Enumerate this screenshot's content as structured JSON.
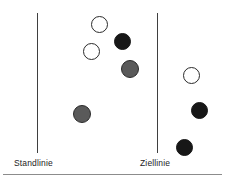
{
  "figure": {
    "width": 225,
    "height": 183,
    "background": "#ffffff"
  },
  "labels": {
    "start_line": "Standlinie",
    "target_line": "Ziellinie"
  },
  "colors": {
    "line": "#3f3f3f",
    "baseline": "#8c8c8c",
    "text": "#1c1c1c",
    "white_token_fill": "#ffffff",
    "white_token_stroke": "#2b2b2b",
    "black_token_fill": "#171717",
    "gray_token_fill": "#5a5a5a",
    "gray_token_stroke": "#2b2b2b"
  },
  "lines": [
    {
      "name": "standlinie-line",
      "x": 37,
      "y_top": 13,
      "y_bottom": 153
    },
    {
      "name": "ziellinie-line",
      "x": 157,
      "y_top": 13,
      "y_bottom": 153
    }
  ],
  "baseline": {
    "x": 3,
    "y": 174,
    "width": 219
  },
  "label_positions": [
    {
      "key": "start_line",
      "x": 14,
      "y": 158
    },
    {
      "key": "target_line",
      "x": 140,
      "y": 158
    }
  ],
  "tokens": [
    {
      "id": "token-1",
      "variant": "white",
      "cx": 99,
      "cy": 24,
      "d": 17
    },
    {
      "id": "token-2",
      "variant": "black",
      "cx": 122,
      "cy": 41,
      "d": 17
    },
    {
      "id": "token-3",
      "variant": "white",
      "cx": 91,
      "cy": 51,
      "d": 17
    },
    {
      "id": "token-4",
      "variant": "gray",
      "cx": 130,
      "cy": 69,
      "d": 18
    },
    {
      "id": "token-5",
      "variant": "white",
      "cx": 191,
      "cy": 75,
      "d": 17
    },
    {
      "id": "token-6",
      "variant": "gray",
      "cx": 82,
      "cy": 114,
      "d": 18
    },
    {
      "id": "token-7",
      "variant": "black",
      "cx": 199,
      "cy": 110,
      "d": 17
    },
    {
      "id": "token-8",
      "variant": "black",
      "cx": 184,
      "cy": 147,
      "d": 17
    }
  ]
}
